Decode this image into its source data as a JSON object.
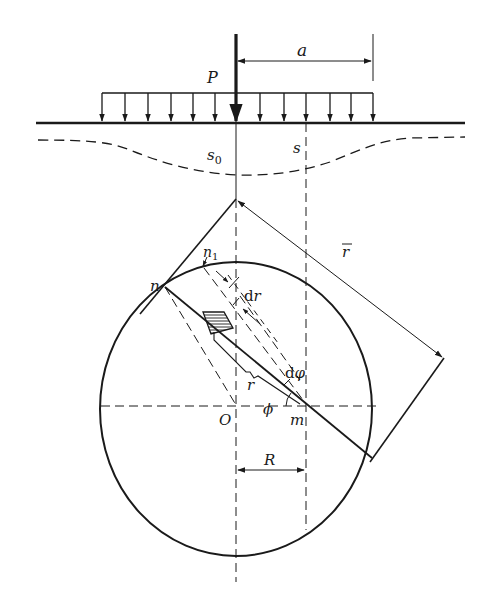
{
  "diagram": {
    "type": "geotechnical settlement / stress distribution sketch",
    "labels": {
      "load": "P",
      "load_half_width": "a",
      "settlement_center": "s",
      "settlement_center_sub": "0",
      "settlement_point": "s",
      "point_n": "n",
      "point_n1": "n",
      "point_n1_sub": "1",
      "radial_increment": "d",
      "radial_increment_var": "r",
      "angle_increment": "d",
      "angle_increment_var": "φ",
      "radius_r": "r",
      "radius_rbar": "r",
      "angle_phi": "ϕ",
      "center_O": "O",
      "point_m": "m",
      "offset_R": "R"
    },
    "colors": {
      "stroke": "#1a1a1a",
      "background": "#ffffff"
    }
  }
}
